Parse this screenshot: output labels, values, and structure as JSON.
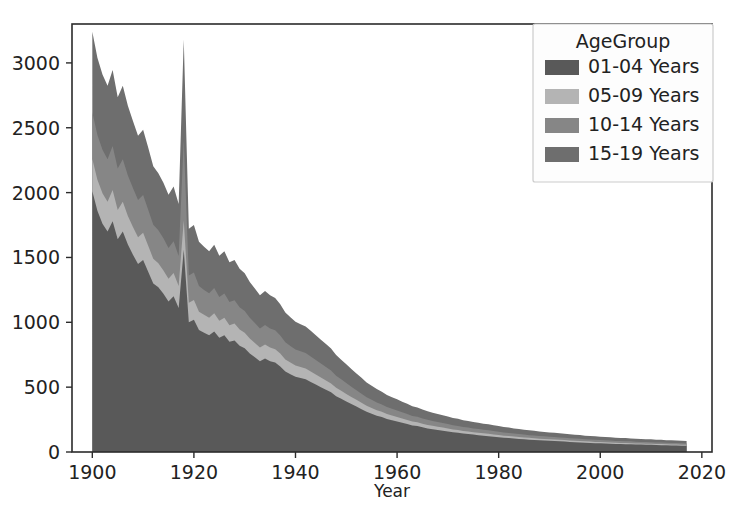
{
  "figure": {
    "title": "",
    "background": "#ffffff",
    "width": 736,
    "height": 530
  },
  "axes": {
    "xlabel": "Year",
    "ylabel": "",
    "x_ticks": [
      "1900",
      "1920",
      "1940",
      "1960",
      "1980",
      "2000",
      "2020"
    ],
    "y_ticks": [
      "0",
      "500",
      "1000",
      "1500",
      "2000",
      "2500",
      "3000"
    ],
    "spine_color": "#2b2b2b"
  },
  "legend": {
    "title": "AgeGroup",
    "entries": [
      {
        "label": "01-04 Years",
        "color": "#595959"
      },
      {
        "label": "05-09 Years",
        "color": "#b4b4b4"
      },
      {
        "label": "10-14 Years",
        "color": "#868686"
      },
      {
        "label": "15-19 Years",
        "color": "#6e6e6e"
      }
    ],
    "frame_color": "#cccccc",
    "background": "#fdfdfd"
  },
  "chart_data": {
    "type": "area",
    "stacked": true,
    "title": "",
    "xlabel": "Year",
    "ylabel": "",
    "xlim": [
      1896,
      2022
    ],
    "ylim": [
      0,
      3300
    ],
    "grid": false,
    "legend_position": "upper right",
    "x": [
      1900,
      1901,
      1902,
      1903,
      1904,
      1905,
      1906,
      1907,
      1908,
      1909,
      1910,
      1911,
      1912,
      1913,
      1914,
      1915,
      1916,
      1917,
      1918,
      1919,
      1920,
      1921,
      1922,
      1923,
      1924,
      1925,
      1926,
      1927,
      1928,
      1929,
      1930,
      1931,
      1932,
      1933,
      1934,
      1935,
      1936,
      1937,
      1938,
      1939,
      1940,
      1941,
      1942,
      1943,
      1944,
      1945,
      1946,
      1947,
      1948,
      1949,
      1950,
      1951,
      1952,
      1953,
      1954,
      1955,
      1956,
      1957,
      1958,
      1959,
      1960,
      1961,
      1962,
      1963,
      1964,
      1965,
      1966,
      1967,
      1968,
      1969,
      1970,
      1971,
      1972,
      1973,
      1974,
      1975,
      1976,
      1977,
      1978,
      1979,
      1980,
      1981,
      1982,
      1983,
      1984,
      1985,
      1986,
      1987,
      1988,
      1989,
      1990,
      1991,
      1992,
      1993,
      1994,
      1995,
      1996,
      1997,
      1998,
      1999,
      2000,
      2001,
      2002,
      2003,
      2004,
      2005,
      2006,
      2007,
      2008,
      2009,
      2010,
      2011,
      2012,
      2013,
      2014,
      2015,
      2016,
      2017
    ],
    "series": [
      {
        "name": "01-04 Years",
        "color": "#595959",
        "values": [
          2010,
          1860,
          1760,
          1700,
          1780,
          1640,
          1700,
          1600,
          1520,
          1450,
          1480,
          1390,
          1300,
          1270,
          1220,
          1160,
          1200,
          1110,
          1560,
          1000,
          1020,
          940,
          920,
          900,
          930,
          880,
          900,
          850,
          860,
          820,
          800,
          760,
          730,
          700,
          720,
          700,
          690,
          660,
          620,
          600,
          580,
          570,
          560,
          540,
          520,
          500,
          480,
          460,
          430,
          410,
          390,
          370,
          350,
          330,
          310,
          295,
          280,
          270,
          255,
          245,
          235,
          225,
          215,
          205,
          200,
          190,
          182,
          176,
          170,
          164,
          158,
          152,
          148,
          142,
          138,
          134,
          130,
          126,
          122,
          118,
          114,
          110,
          107,
          104,
          101,
          98,
          95,
          92,
          90,
          88,
          86,
          84,
          82,
          80,
          78,
          76,
          74,
          72,
          70,
          68,
          67,
          65,
          64,
          62,
          61,
          60,
          59,
          58,
          57,
          56,
          55,
          54,
          53,
          52,
          51,
          50,
          49,
          48
        ]
      },
      {
        "name": "05-09 Years",
        "color": "#b4b4b4",
        "values": [
          250,
          240,
          235,
          230,
          240,
          225,
          230,
          220,
          215,
          205,
          210,
          200,
          190,
          185,
          180,
          175,
          180,
          170,
          225,
          150,
          152,
          142,
          138,
          136,
          140,
          132,
          135,
          128,
          130,
          124,
          120,
          115,
          110,
          105,
          108,
          105,
          103,
          99,
          94,
          90,
          87,
          85,
          84,
          81,
          78,
          75,
          72,
          69,
          65,
          62,
          58,
          55,
          52,
          49,
          46,
          44,
          42,
          40,
          38,
          36,
          35,
          33,
          32,
          30,
          29,
          28,
          27,
          26,
          25,
          24,
          23,
          22,
          21,
          20,
          20,
          19,
          19,
          18,
          18,
          17,
          17,
          16,
          16,
          15,
          15,
          14,
          14,
          14,
          13,
          13,
          13,
          12,
          12,
          12,
          11,
          11,
          11,
          10,
          10,
          10,
          10,
          10,
          9,
          9,
          9,
          9,
          9,
          8,
          8,
          8,
          8,
          8,
          8,
          7,
          7,
          7,
          7,
          7
        ]
      },
      {
        "name": "10-14 Years",
        "color": "#868686",
        "values": [
          360,
          345,
          335,
          328,
          340,
          320,
          328,
          312,
          300,
          288,
          292,
          278,
          262,
          255,
          248,
          238,
          245,
          232,
          620,
          210,
          212,
          198,
          192,
          188,
          194,
          184,
          188,
          178,
          180,
          172,
          168,
          160,
          154,
          148,
          152,
          148,
          145,
          140,
          133,
          128,
          124,
          121,
          119,
          115,
          111,
          107,
          103,
          99,
          93,
          88,
          84,
          79,
          75,
          71,
          66,
          63,
          60,
          57,
          54,
          52,
          50,
          48,
          46,
          43,
          42,
          40,
          39,
          37,
          36,
          35,
          34,
          33,
          32,
          30,
          30,
          29,
          28,
          27,
          27,
          26,
          25,
          24,
          24,
          23,
          22,
          22,
          21,
          21,
          20,
          20,
          19,
          19,
          18,
          18,
          17,
          17,
          17,
          16,
          16,
          16,
          15,
          15,
          15,
          14,
          14,
          14,
          14,
          13,
          13,
          13,
          13,
          12,
          12,
          12,
          12,
          12,
          11,
          11
        ]
      },
      {
        "name": "15-19 Years",
        "color": "#6e6e6e",
        "values": [
          620,
          595,
          580,
          565,
          585,
          550,
          565,
          538,
          518,
          495,
          503,
          480,
          452,
          440,
          428,
          410,
          422,
          400,
          775,
          362,
          366,
          342,
          332,
          324,
          334,
          318,
          324,
          307,
          311,
          297,
          290,
          276,
          266,
          255,
          262,
          255,
          250,
          241,
          229,
          221,
          214,
          209,
          205,
          198,
          191,
          184,
          178,
          170,
          160,
          152,
          144,
          136,
          129,
          122,
          114,
          109,
          103,
          98,
          93,
          89,
          86,
          82,
          79,
          75,
          72,
          69,
          67,
          64,
          62,
          60,
          58,
          56,
          55,
          52,
          51,
          49,
          48,
          47,
          46,
          45,
          44,
          42,
          41,
          40,
          39,
          38,
          37,
          36,
          35,
          34,
          33,
          33,
          32,
          31,
          30,
          29,
          29,
          28,
          27,
          27,
          26,
          26,
          25,
          25,
          24,
          24,
          23,
          23,
          22,
          22,
          22,
          21,
          21,
          20,
          20,
          20,
          19,
          19
        ]
      }
    ]
  }
}
